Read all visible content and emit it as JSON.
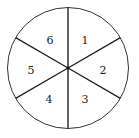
{
  "diagram": {
    "type": "spinner",
    "sectors": 6,
    "labels": [
      "1",
      "2",
      "3",
      "4",
      "5",
      "6"
    ],
    "stroke_color": "#222222",
    "fill_color": "#ffffff"
  }
}
